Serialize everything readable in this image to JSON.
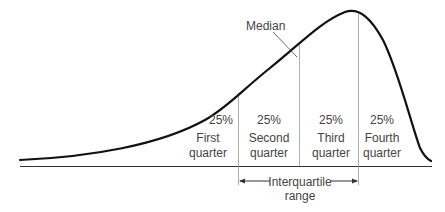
{
  "diagram": {
    "type": "skewed-distribution-quartiles",
    "median_label": "Median",
    "quarters": [
      {
        "percent": "25%",
        "line1": "First",
        "line2": "quarter"
      },
      {
        "percent": "25%",
        "line1": "Second",
        "line2": "quarter"
      },
      {
        "percent": "25%",
        "line1": "Third",
        "line2": "quarter"
      },
      {
        "percent": "25%",
        "line1": "Fourth",
        "line2": "quarter"
      }
    ],
    "iqr_label_line1": "Interquartile",
    "iqr_label_line2": "range",
    "colors": {
      "curve": "#111111",
      "baseline": "#333333",
      "divider": "#999999",
      "text": "#444444"
    }
  }
}
